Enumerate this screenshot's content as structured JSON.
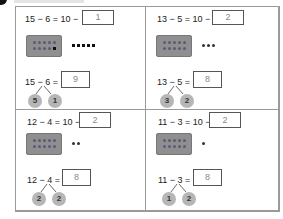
{
  "exercise": {
    "bullet_icon": "black-quarter-circle",
    "instructions": ""
  },
  "panels": [
    {
      "expression_top": "15 − 6 = 10 −",
      "answer_top": "1",
      "frame_dots": 10,
      "extra_dots": 5,
      "expression_bottom": "15 − 6 =",
      "answer_bottom": "9",
      "bond_left": "5",
      "bond_right": "1"
    },
    {
      "expression_top": "13 − 5 = 10 −",
      "answer_top": "2",
      "frame_dots": 10,
      "extra_dots": 3,
      "expression_bottom": "13 − 5 =",
      "answer_bottom": "8",
      "bond_left": "3",
      "bond_right": "2"
    },
    {
      "expression_top": "12 − 4 = 10 −",
      "answer_top": "2",
      "frame_dots": 10,
      "extra_dots": 2,
      "expression_bottom": "12 − 4 =",
      "answer_bottom": "8",
      "bond_left": "2",
      "bond_right": "2"
    },
    {
      "expression_top": "11 − 3 = 10 −",
      "answer_top": "2",
      "frame_dots": 10,
      "extra_dots": 1,
      "expression_bottom": "11 − 3 =",
      "answer_bottom": "8",
      "bond_left": "1",
      "bond_right": "2"
    }
  ],
  "colors": {
    "frame": "#8f8f8f",
    "bond_circle": "#b6b6b6",
    "border": "#9a9a9a"
  }
}
